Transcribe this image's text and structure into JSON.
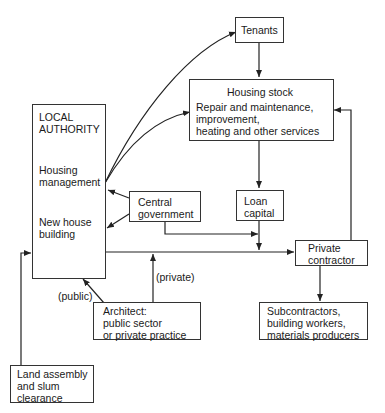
{
  "diagram": {
    "nodes": {
      "tenants": {
        "label": "Tenants"
      },
      "housing_stock": {
        "title": "Housing stock",
        "lines": [
          "Repair and maintenance,",
          "improvement,",
          "heating and other services"
        ]
      },
      "local_authority": {
        "title_lines": [
          "LOCAL",
          "AUTHORITY"
        ],
        "housing_management": [
          "Housing",
          "management"
        ],
        "new_house_building": [
          "New house",
          "building"
        ]
      },
      "central_government": {
        "lines": [
          "Central",
          "government"
        ]
      },
      "loan_capital": {
        "lines": [
          "Loan",
          "capital"
        ]
      },
      "private_contractor": {
        "lines": [
          "Private",
          "contractor"
        ]
      },
      "subcontractors": {
        "lines": [
          "Subcontractors,",
          "building workers,",
          "materials producers"
        ]
      },
      "architect": {
        "lines": [
          "Architect:",
          "public sector",
          "or private practice"
        ]
      },
      "land_assembly": {
        "lines": [
          "Land assembly",
          "and slum",
          "clearance"
        ]
      }
    },
    "edge_labels": {
      "public": "(public)",
      "private": "(private)"
    },
    "edges": [
      {
        "from": "local_authority.housing_management",
        "to": "tenants"
      },
      {
        "from": "local_authority.housing_management",
        "to": "housing_stock"
      },
      {
        "from": "tenants",
        "to": "housing_stock"
      },
      {
        "from": "housing_stock",
        "to": "loan_capital"
      },
      {
        "from": "central_government",
        "to": "local_authority.housing_management"
      },
      {
        "from": "central_government",
        "to": "local_authority.new_house_building"
      },
      {
        "from": "central_government",
        "to": "loan_capital_junction"
      },
      {
        "from": "loan_capital",
        "to": "private_contractor"
      },
      {
        "from": "local_authority.new_house_building",
        "to": "private_contractor"
      },
      {
        "from": "private_contractor",
        "to": "housing_stock"
      },
      {
        "from": "private_contractor",
        "to": "subcontractors"
      },
      {
        "from": "architect",
        "to": "local_authority",
        "label": "(public)"
      },
      {
        "from": "architect",
        "to": "private_contractor_line",
        "label": "(private)"
      },
      {
        "from": "land_assembly",
        "to": "local_authority.new_house_building"
      }
    ]
  }
}
